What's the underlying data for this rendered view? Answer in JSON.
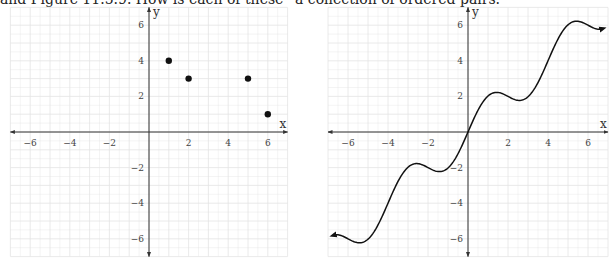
{
  "caption": "and Figure 11.5.9. How is each of these “a collection of ordered pairs.”",
  "colors": {
    "grid": "#e4e4e4",
    "axis": "#333333",
    "ink": "#111111"
  },
  "chart_data": [
    {
      "type": "scatter",
      "title": "",
      "xlabel": "x",
      "ylabel": "y",
      "xlim": [
        -7,
        7
      ],
      "ylim": [
        -7,
        7
      ],
      "xticks": [
        -6,
        -4,
        -2,
        2,
        4,
        6
      ],
      "yticks": [
        -6,
        -4,
        -2,
        2,
        4,
        6
      ],
      "grid": true,
      "points": [
        {
          "x": 1,
          "y": 4
        },
        {
          "x": 2,
          "y": 3
        },
        {
          "x": 5,
          "y": 3
        },
        {
          "x": 6,
          "y": 1
        }
      ]
    },
    {
      "type": "line",
      "title": "",
      "xlabel": "x",
      "ylabel": "y",
      "xlim": [
        -7,
        7
      ],
      "ylim": [
        -7,
        7
      ],
      "xticks": [
        -6,
        -4,
        -2,
        2,
        4,
        6
      ],
      "yticks": [
        -6,
        -4,
        -2,
        2,
        4,
        6
      ],
      "grid": true,
      "description": "smooth increasing wavy curve through origin with arrowheads at both ends",
      "x": [
        -6.7,
        -6,
        -5.3,
        -4,
        -3,
        -2.6,
        -2,
        -1.4,
        0,
        1.4,
        2,
        2.6,
        3,
        4,
        5.3,
        6,
        6.7
      ],
      "y": [
        -5.8,
        -6,
        -6.2,
        -4,
        -2.2,
        -1.8,
        -2,
        -2.2,
        0,
        2.2,
        2,
        1.8,
        2.2,
        4,
        6.2,
        6,
        5.8
      ]
    }
  ]
}
